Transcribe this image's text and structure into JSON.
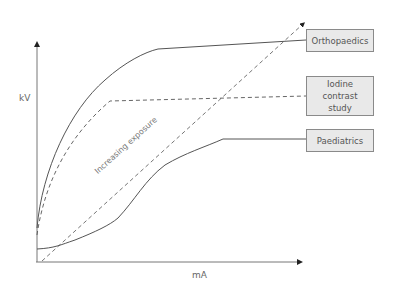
{
  "diagram": {
    "axes": {
      "y_label": "kV",
      "x_label": "mA"
    },
    "diagonal_annotation": "Increasing exposure",
    "curves": [
      {
        "name": "Orthopaedics",
        "style": "solid",
        "label_lines": [
          "Orthopaedics"
        ]
      },
      {
        "name": "Iodine contrast study",
        "style": "dashed",
        "label_lines": [
          "Iodine",
          "contrast",
          "study"
        ]
      },
      {
        "name": "Paediatrics",
        "style": "solid",
        "label_lines": [
          "Paediatrics"
        ]
      }
    ],
    "colors": {
      "line": "#555555",
      "box_fill": "#e9e9e9",
      "box_border": "#8a8a8a",
      "text": "#666666"
    }
  }
}
